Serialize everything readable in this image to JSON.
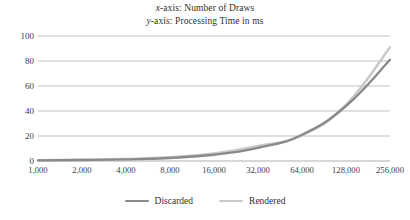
{
  "chart_data": {
    "type": "line",
    "title_lines": [
      {
        "prefix": "x",
        "rest": "-axis: Number of Draws"
      },
      {
        "prefix": "y",
        "rest": "-axis: Processing Time in ms"
      }
    ],
    "xlabel": "Number of Draws",
    "ylabel": "Processing Time in ms",
    "categories": [
      "1,000",
      "2,000",
      "4,000",
      "8,000",
      "16,000",
      "32,000",
      "64,000",
      "128,000",
      "256,000"
    ],
    "x_values": [
      1000,
      2000,
      4000,
      8000,
      16000,
      32000,
      64000,
      128000,
      256000
    ],
    "ylim": [
      0,
      100
    ],
    "yticks": [
      0,
      20,
      40,
      60,
      80,
      100
    ],
    "grid": "horizontal",
    "legend_position": "bottom",
    "series": [
      {
        "name": "Discarded",
        "color": "#8a8a8a",
        "values": [
          0.5,
          0.8,
          1.3,
          2.4,
          5.0,
          10.5,
          21.0,
          44.0,
          81.0
        ]
      },
      {
        "name": "Rendered",
        "color": "#c9c9c9",
        "values": [
          0.6,
          1.0,
          1.6,
          3.0,
          6.0,
          12.0,
          20.5,
          45.0,
          91.0
        ]
      }
    ]
  },
  "axis": {
    "gridline_color": "#a6a6a6",
    "tick_label_color": "#404040"
  },
  "legend": {
    "items": [
      {
        "label": "Discarded",
        "color": "#8a8a8a"
      },
      {
        "label": "Rendered",
        "color": "#c9c9c9"
      }
    ]
  }
}
